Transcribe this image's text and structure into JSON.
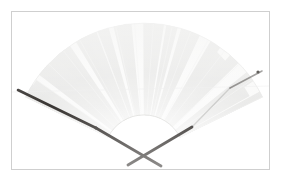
{
  "image": {
    "subject": "folding hand fan",
    "orientation": "open",
    "background_color": "#ffffff",
    "width": 282,
    "height": 181
  },
  "frame": {
    "border_color": "#cfcfcf",
    "border_width": 1,
    "left": 11,
    "top": 11,
    "right": 270,
    "bottom": 170,
    "inner_fill": "#ffffff"
  },
  "fan": {
    "pivot_x": 144,
    "pivot_y": 155,
    "outer_radius": 132,
    "inner_radius": 40,
    "start_angle_deg": 206,
    "end_angle_deg": 334,
    "leaf_base_color": "#f6f6f5",
    "stripe_color": "#dcdcda",
    "stripe_count": 20,
    "edge_color": "#e4e4e2",
    "rib_shadow_color": "#e9e9e7"
  },
  "guard_sticks": {
    "color": "#231f1c",
    "thickness": 2.4,
    "left": {
      "tip_x": 18,
      "tip_y": 90,
      "end_x": 161,
      "end_y": 166
    },
    "right": {
      "tip_x": 262,
      "tip_y": 71,
      "end_x": 128,
      "end_y": 165
    },
    "crossing_x": 144,
    "crossing_y": 155
  },
  "marks": {
    "right_tip_dot_x": 258,
    "right_tip_dot_y": 72,
    "left_elbow_x": 96,
    "left_elbow_y": 128,
    "right_elbow_x": 192,
    "right_elbow_y": 127
  },
  "alt_text": "A white and pale grey striped folding fan shown fully open, photographed against a white background inside a thin grey rectangular border."
}
